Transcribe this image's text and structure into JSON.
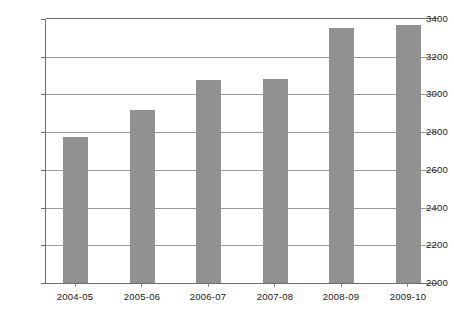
{
  "chart_data": {
    "type": "bar",
    "title": "",
    "subtitle": "",
    "xlabel": "",
    "ylabel": "",
    "categories": [
      "2004-05",
      "2005-06",
      "2006-07",
      "2007-08",
      "2008-09",
      "2009-10"
    ],
    "values": [
      2775,
      2920,
      3075,
      3080,
      3350,
      3370
    ],
    "series": [
      {
        "name": "",
        "values": [
          2775,
          2920,
          3075,
          3080,
          3350,
          3370
        ]
      }
    ],
    "ylim": [
      2000,
      3400
    ],
    "yticks": [
      2000,
      2200,
      2400,
      2600,
      2800,
      3000,
      3200,
      3400
    ],
    "ytick_labels": [
      "2000",
      "2200",
      "2400",
      "2600",
      "2800",
      "3000",
      "3200",
      "3400"
    ],
    "grid": true,
    "grid_axis": "y",
    "legend": false,
    "legend_position": "none",
    "annotations": [],
    "bar_color": "#919191",
    "axis_color": "#6e6e6e",
    "gridline_color": "#9a9a9a",
    "background_color": "#ffffff",
    "text_color": "#1a1a1a"
  }
}
